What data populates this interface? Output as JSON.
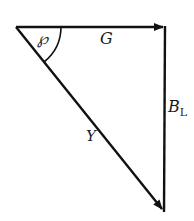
{
  "diagram": {
    "type": "vector-triangle",
    "stroke_color": "#111111",
    "vectors": [
      {
        "id": "G",
        "label": "G",
        "from": [
          16,
          27
        ],
        "to": [
          165,
          27
        ]
      },
      {
        "id": "B_L",
        "label": "B",
        "subscript": "L",
        "from": [
          165,
          27
        ],
        "to": [
          164,
          212
        ]
      },
      {
        "id": "Y",
        "label": "Y",
        "from": [
          16,
          27
        ],
        "to": [
          164,
          212
        ]
      }
    ],
    "angle": {
      "label": "℘",
      "vertex": [
        16,
        27
      ],
      "radius": 45
    }
  }
}
